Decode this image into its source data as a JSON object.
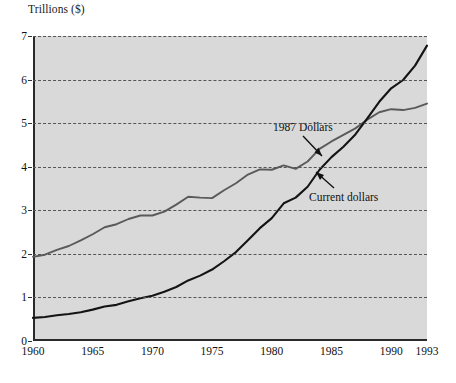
{
  "chart_data": {
    "type": "line",
    "title": "",
    "ylabel": "Trillions ($)",
    "xlabel": "",
    "xlim": [
      1960,
      1993
    ],
    "ylim": [
      0,
      7
    ],
    "grid": true,
    "legend_position": "inline-annotations",
    "xticks": [
      1960,
      1965,
      1970,
      1975,
      1980,
      1985,
      1990,
      1993
    ],
    "xtick_labels": [
      "1960",
      "1965",
      "1970",
      "1975",
      "1980",
      "1985",
      "1990",
      "1993"
    ],
    "yticks": [
      0,
      1,
      2,
      3,
      4,
      5,
      6,
      7
    ],
    "ytick_labels": [
      "0",
      "1",
      "2",
      "3",
      "4",
      "5",
      "6",
      "7"
    ],
    "x": [
      1960,
      1961,
      1962,
      1963,
      1964,
      1965,
      1966,
      1967,
      1968,
      1969,
      1970,
      1971,
      1972,
      1973,
      1974,
      1975,
      1976,
      1977,
      1978,
      1979,
      1980,
      1981,
      1982,
      1983,
      1984,
      1985,
      1986,
      1987,
      1988,
      1989,
      1990,
      1991,
      1992,
      1993
    ],
    "series": [
      {
        "name": "1987 Dollars",
        "color": "#5a5a5a",
        "values": [
          1.93,
          1.98,
          2.09,
          2.18,
          2.31,
          2.45,
          2.61,
          2.68,
          2.8,
          2.88,
          2.88,
          2.97,
          3.13,
          3.31,
          3.29,
          3.28,
          3.46,
          3.62,
          3.82,
          3.94,
          3.93,
          4.03,
          3.95,
          4.12,
          4.41,
          4.58,
          4.73,
          4.88,
          5.08,
          5.25,
          5.32,
          5.3,
          5.35,
          5.45
        ]
      },
      {
        "name": "Current dollars",
        "color": "#141414",
        "values": [
          0.53,
          0.55,
          0.59,
          0.62,
          0.66,
          0.72,
          0.79,
          0.83,
          0.91,
          0.98,
          1.04,
          1.13,
          1.24,
          1.39,
          1.5,
          1.64,
          1.83,
          2.04,
          2.31,
          2.59,
          2.82,
          3.16,
          3.29,
          3.54,
          3.93,
          4.22,
          4.46,
          4.74,
          5.11,
          5.49,
          5.8,
          5.99,
          6.32,
          6.78
        ]
      }
    ],
    "annotations": [
      {
        "text": "1987 Dollars",
        "points_to_series": "1987 Dollars"
      },
      {
        "text": "Current dollars",
        "points_to_series": "Current dollars"
      }
    ]
  }
}
